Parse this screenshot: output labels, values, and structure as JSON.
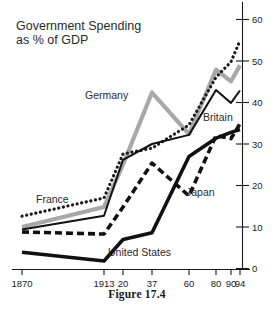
{
  "figure": {
    "caption": "Figure 17.4"
  },
  "chart_data": {
    "type": "line",
    "title": "Government Spending\nas % of GDP",
    "title_line1": "Government Spending",
    "title_line2": "as % of GDP",
    "xlabel": "",
    "ylabel": "",
    "grid": false,
    "legend_position": "inline-labels",
    "y_axis_side": "right",
    "ylim": [
      0,
      60
    ],
    "yticks": [
      0,
      10,
      20,
      30,
      40,
      50,
      60
    ],
    "ytick_labels": [
      "0",
      "10",
      "20",
      "30",
      "40",
      "50",
      "60"
    ],
    "x": [
      1870,
      1913,
      1920,
      1937,
      1960,
      1980,
      1990,
      1994
    ],
    "xtick_labels": [
      "1870",
      "1913",
      "20",
      "37",
      "60",
      "80",
      "90",
      "94"
    ],
    "series": [
      {
        "name": "France",
        "label": "France",
        "style": "dotted",
        "color": "#1a1a1a",
        "values": [
          12.6,
          17.0,
          27.6,
          29.0,
          34.6,
          46.1,
          49.8,
          54.9
        ]
      },
      {
        "name": "Germany",
        "label": "Germany",
        "style": "solid-thick-gray",
        "color": "#a8a8a8",
        "values": [
          10.0,
          14.8,
          25.0,
          42.4,
          32.4,
          47.9,
          45.1,
          49.0
        ]
      },
      {
        "name": "Britain",
        "label": "Britain",
        "style": "solid-thin",
        "color": "#111111",
        "values": [
          9.4,
          12.7,
          26.2,
          30.0,
          32.2,
          43.0,
          39.9,
          42.9
        ]
      },
      {
        "name": "Japan",
        "label": "Japan",
        "style": "dashed-thick",
        "color": "#111111",
        "values": [
          8.8,
          8.3,
          14.8,
          25.4,
          17.5,
          32.0,
          31.3,
          34.9
        ]
      },
      {
        "name": "United States",
        "label": "United States",
        "style": "solid-thick",
        "color": "#111111",
        "values": [
          3.9,
          1.8,
          7.0,
          8.6,
          27.0,
          31.4,
          32.8,
          33.5
        ]
      }
    ]
  }
}
